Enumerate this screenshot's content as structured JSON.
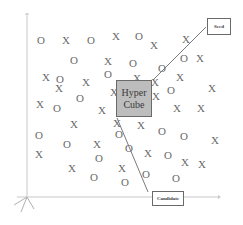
{
  "diagram": {
    "hypercube": {
      "line1": "Hyper",
      "line2": "Cube"
    },
    "seed": {
      "label": "Seed"
    },
    "candidate": {
      "label": "Candidate"
    },
    "colors": {
      "axis": "#c8c8c8",
      "marker": "#6a6a6a",
      "cube_fill": "#bdbdbd",
      "cube_border": "#6a6a6a",
      "path_line": "#7a7a7a"
    },
    "axes": {
      "origin": [
        27,
        197
      ],
      "y_top": [
        27,
        13
      ],
      "x_end": [
        218,
        197
      ]
    },
    "path": {
      "seed_to_cube": [
        [
          206,
          27
        ],
        [
          153,
          80
        ]
      ],
      "cube_to_candidate": [
        [
          117,
          118
        ],
        [
          148,
          192
        ]
      ]
    },
    "markers": [
      {
        "type": "O",
        "x": 41,
        "y": 40
      },
      {
        "type": "X",
        "x": 66,
        "y": 40
      },
      {
        "type": "O",
        "x": 91,
        "y": 40
      },
      {
        "type": "X",
        "x": 116,
        "y": 36
      },
      {
        "type": "O",
        "x": 139,
        "y": 36
      },
      {
        "type": "X",
        "x": 154,
        "y": 45
      },
      {
        "type": "X",
        "x": 186,
        "y": 39
      },
      {
        "type": "O",
        "x": 74,
        "y": 60
      },
      {
        "type": "X",
        "x": 108,
        "y": 61
      },
      {
        "type": "O",
        "x": 133,
        "y": 63
      },
      {
        "type": "O",
        "x": 162,
        "y": 68
      },
      {
        "type": "O",
        "x": 184,
        "y": 58
      },
      {
        "type": "X",
        "x": 200,
        "y": 58
      },
      {
        "type": "X",
        "x": 46,
        "y": 77
      },
      {
        "type": "O",
        "x": 60,
        "y": 79
      },
      {
        "type": "X",
        "x": 59,
        "y": 88
      },
      {
        "type": "X",
        "x": 86,
        "y": 82
      },
      {
        "type": "O",
        "x": 108,
        "y": 74
      },
      {
        "type": "X",
        "x": 114,
        "y": 92
      },
      {
        "type": "X",
        "x": 137,
        "y": 78
      },
      {
        "type": "X",
        "x": 155,
        "y": 82
      },
      {
        "type": "X",
        "x": 180,
        "y": 77
      },
      {
        "type": "O",
        "x": 171,
        "y": 90
      },
      {
        "type": "X",
        "x": 212,
        "y": 88
      },
      {
        "type": "X",
        "x": 156,
        "y": 96
      },
      {
        "type": "O",
        "x": 80,
        "y": 98
      },
      {
        "type": "X",
        "x": 40,
        "y": 104
      },
      {
        "type": "O",
        "x": 57,
        "y": 108
      },
      {
        "type": "X",
        "x": 102,
        "y": 110
      },
      {
        "type": "X",
        "x": 177,
        "y": 108
      },
      {
        "type": "X",
        "x": 201,
        "y": 108
      },
      {
        "type": "X",
        "x": 74,
        "y": 124
      },
      {
        "type": "X",
        "x": 117,
        "y": 123
      },
      {
        "type": "X",
        "x": 141,
        "y": 125
      },
      {
        "type": "O",
        "x": 162,
        "y": 131
      },
      {
        "type": "O",
        "x": 184,
        "y": 136
      },
      {
        "type": "X",
        "x": 215,
        "y": 140
      },
      {
        "type": "O",
        "x": 39,
        "y": 135
      },
      {
        "type": "O",
        "x": 119,
        "y": 134
      },
      {
        "type": "O",
        "x": 67,
        "y": 144
      },
      {
        "type": "X",
        "x": 97,
        "y": 144
      },
      {
        "type": "O",
        "x": 129,
        "y": 148
      },
      {
        "type": "X",
        "x": 148,
        "y": 153
      },
      {
        "type": "O",
        "x": 168,
        "y": 155
      },
      {
        "type": "X",
        "x": 185,
        "y": 162
      },
      {
        "type": "X",
        "x": 202,
        "y": 164
      },
      {
        "type": "X",
        "x": 39,
        "y": 154
      },
      {
        "type": "O",
        "x": 99,
        "y": 158
      },
      {
        "type": "X",
        "x": 72,
        "y": 168
      },
      {
        "type": "X",
        "x": 122,
        "y": 168
      },
      {
        "type": "O",
        "x": 146,
        "y": 174
      },
      {
        "type": "O",
        "x": 176,
        "y": 178
      },
      {
        "type": "O",
        "x": 94,
        "y": 177
      },
      {
        "type": "O",
        "x": 125,
        "y": 182
      }
    ]
  }
}
